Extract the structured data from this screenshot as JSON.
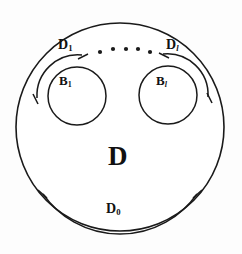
{
  "figure": {
    "stroke_color": "#1a1a1a",
    "fill_color": "#ffffff",
    "background_color": "#fdfdfd"
  },
  "labels": {
    "outer_domain": "D",
    "outer_boundary": {
      "base": "D",
      "sub": "0"
    },
    "hole_first": {
      "base": "B",
      "sub": "1"
    },
    "hole_last": {
      "base": "B",
      "sub": "l"
    },
    "hole_first_boundary": {
      "base": "D",
      "sub": "1"
    },
    "hole_last_boundary": {
      "base": "D",
      "sub": "l"
    }
  },
  "ellipsis": {
    "label": "dots",
    "count": 5
  },
  "shapes": {
    "outer_circle": {
      "cx": 120,
      "cy": 127,
      "r": 104
    },
    "hole_left": {
      "cx": 77,
      "cy": 96,
      "r": 29
    },
    "hole_right": {
      "cx": 168,
      "cy": 95,
      "r": 29
    }
  }
}
